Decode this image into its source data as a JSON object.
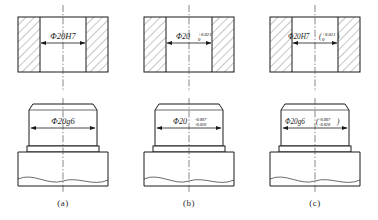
{
  "figure": {
    "type": "engineering-drawing",
    "background_color": "#ffffff",
    "line_color": "#1a1a1a",
    "panels": [
      {
        "caption": "(a)",
        "notation_style": "fit-symbol",
        "hole": {
          "view": "sectioned-hole",
          "dimension": "Φ20H7",
          "basic_size": "Φ20",
          "tolerance_symbol": "H7",
          "upper_deviation": "",
          "lower_deviation": ""
        },
        "shaft": {
          "view": "shaft-on-base",
          "dimension": "Φ20g6",
          "basic_size": "Φ20",
          "tolerance_symbol": "g6",
          "upper_deviation": "",
          "lower_deviation": ""
        }
      },
      {
        "caption": "(b)",
        "notation_style": "deviation-values",
        "hole": {
          "view": "sectioned-hole",
          "dimension": "Φ20",
          "basic_size": "Φ20",
          "tolerance_symbol": "",
          "upper_deviation": "+0.021",
          "lower_deviation": "0"
        },
        "shaft": {
          "view": "shaft-on-base",
          "dimension": "Φ20",
          "basic_size": "Φ20",
          "tolerance_symbol": "",
          "upper_deviation": "-0.007",
          "lower_deviation": "-0.020"
        }
      },
      {
        "caption": "(c)",
        "notation_style": "symbol-with-deviations",
        "hole": {
          "view": "sectioned-hole",
          "dimension": "Φ20H7",
          "basic_size": "Φ20",
          "tolerance_symbol": "H7",
          "open_paren": "(",
          "close_paren": ")",
          "upper_deviation": "+0.021",
          "lower_deviation": "0"
        },
        "shaft": {
          "view": "shaft-on-base",
          "dimension": "Φ20g6",
          "basic_size": "Φ20",
          "tolerance_symbol": "g6",
          "open_paren": "(",
          "close_paren": ")",
          "upper_deviation": "-0.007",
          "lower_deviation": "-0.020"
        }
      }
    ]
  }
}
